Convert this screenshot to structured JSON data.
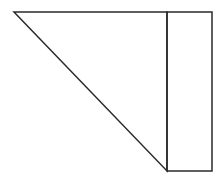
{
  "diagram": {
    "width": 224,
    "height": 180,
    "stroke_color": "#2a2a2a",
    "stroke_width": 1.5,
    "background": "#ffffff",
    "shapes": [
      {
        "type": "triangle",
        "name": "right-triangle",
        "points": [
          [
            14,
            12
          ],
          [
            167,
            12
          ],
          [
            167,
            171
          ]
        ]
      },
      {
        "type": "rectangle",
        "name": "tall-rectangle",
        "x": 167,
        "y": 12,
        "width": 45,
        "height": 159
      }
    ]
  }
}
